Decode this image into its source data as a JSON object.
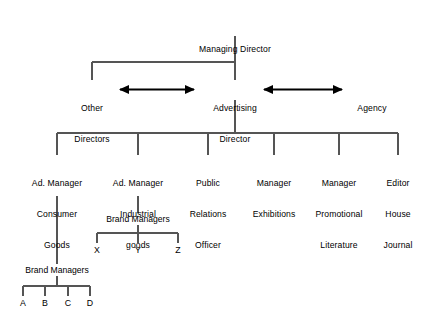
{
  "diagram": {
    "type": "organizational-chart",
    "root": {
      "label": "Managing Director"
    },
    "level2": {
      "center": {
        "line1": "Advertising",
        "line2": "Director"
      },
      "left": {
        "line1": "Other",
        "line2": "Directors"
      },
      "right": {
        "label": "Agency"
      }
    },
    "departments": [
      {
        "line1": "Ad. Manager",
        "line2": "Consumer",
        "line3": "Goods"
      },
      {
        "line1": "Ad. Manager",
        "line2": "Industrial",
        "line3": "goods"
      },
      {
        "line1": "Public",
        "line2": "Relations",
        "line3": "Officer"
      },
      {
        "line1": "Manager",
        "line2": "Exhibitions",
        "line3": ""
      },
      {
        "line1": "Manager",
        "line2": "Promotional",
        "line3": "Literature"
      },
      {
        "line1": "Editor",
        "line2": "House",
        "line3": "Journal"
      }
    ],
    "brand_group_industrial": {
      "label": "Brand Managers",
      "brands": [
        "X",
        "Y",
        "Z"
      ]
    },
    "brand_group_consumer": {
      "label": "Brand Managers",
      "brands": [
        "A",
        "B",
        "C",
        "D"
      ]
    },
    "colors": {
      "line": "#555555",
      "arrow": "#000000",
      "text": "#000000",
      "background": "#ffffff"
    }
  }
}
